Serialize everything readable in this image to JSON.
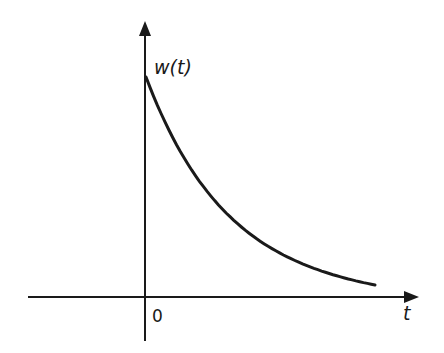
{
  "chart_data": {
    "type": "line",
    "title": "",
    "xlabel": "t",
    "ylabel": "w(t)",
    "origin_label": "0",
    "function": "w(t) = A e^(-t/tau), t >= 0",
    "series": [
      {
        "name": "w(t)",
        "x": [
          0,
          0.5,
          1,
          1.5,
          2,
          2.5,
          3,
          3.5,
          4,
          4.5,
          5
        ],
        "values": [
          1.0,
          0.78,
          0.6,
          0.47,
          0.36,
          0.28,
          0.22,
          0.17,
          0.13,
          0.1,
          0.06
        ]
      }
    ],
    "grid": false,
    "legend": false,
    "axis_arrows": true
  },
  "labels": {
    "y_axis": "w(t)",
    "x_axis": "t",
    "origin": "0"
  },
  "colors": {
    "stroke": "#1a1a1a",
    "background": "#ffffff"
  }
}
